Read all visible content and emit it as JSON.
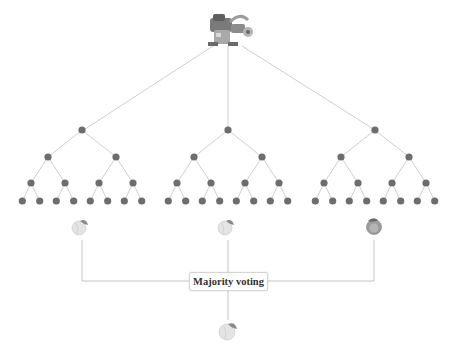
{
  "diagram": {
    "root_icon": "robot-icon",
    "trees": [
      {
        "name": "tree-1",
        "root_x": 82,
        "prediction_icon": "peach-icon"
      },
      {
        "name": "tree-2",
        "root_x": 228,
        "prediction_icon": "peach-icon"
      },
      {
        "name": "tree-3",
        "root_x": 375,
        "prediction_icon": "orange-icon"
      }
    ],
    "aggregator_label": "Majority voting",
    "final_prediction_icon": "peach-icon"
  },
  "colors": {
    "node": "#6d6d6d",
    "edge": "#cfcfcf",
    "peach": "#e6e6e6",
    "orange": "#9a9a9a"
  }
}
